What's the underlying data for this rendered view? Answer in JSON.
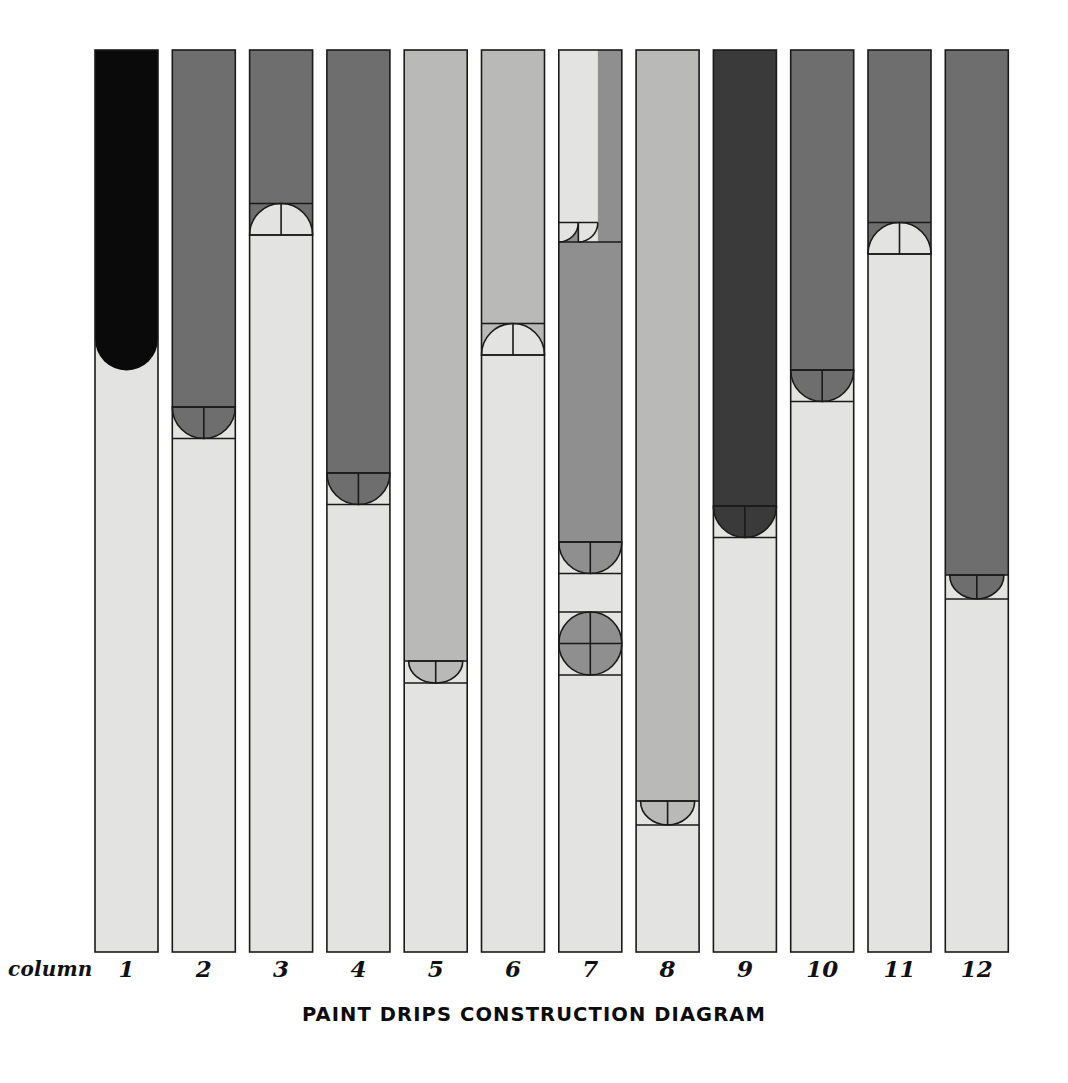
{
  "title": "PAINT DRIPS CONSTRUCTION DIAGRAM",
  "axis": {
    "row_label": "column",
    "numbers": [
      "1",
      "2",
      "3",
      "4",
      "5",
      "6",
      "7",
      "8",
      "9",
      "10",
      "11",
      "12"
    ]
  },
  "palette": {
    "background": "#ffffff",
    "outline": "#1a1a1a",
    "body_light": "#e3e3e1",
    "ink_black": "#0a0a0a",
    "ink_dark": "#3a3a3a",
    "ink_mid_dark": "#6e6e6e",
    "ink_mid": "#8f8f8f",
    "ink_light": "#b9b9b7",
    "ink_pale": "#d6d6d4",
    "ink_paler": "#ececea"
  },
  "chart_data": {
    "type": "diagram",
    "title": "PAINT DRIPS CONSTRUCTION DIAGRAM",
    "xlabel": "column",
    "ylabel": "",
    "grid": false,
    "legend": "none",
    "geometry": {
      "columns_total": 12,
      "column_width_px": 63,
      "column_pitch_px": 77.3,
      "first_column_left_px": 95,
      "top_px": 50,
      "bottom_px": 952,
      "note": "Each column is a vertical bar of paint that has run down from the top; the paint front terminates in a semicircular drip bead of the same radius as the column half-width. Construction lines show the bead's bounding box, its vertical centre line and, for full circles, the horizontal centre line."
    },
    "categories": [
      "1",
      "2",
      "3",
      "4",
      "5",
      "6",
      "7",
      "8",
      "9",
      "10",
      "11",
      "12"
    ],
    "values": [
      289,
      357,
      185,
      423,
      611,
      305,
      192,
      751,
      456,
      320,
      204,
      525
    ],
    "series": [
      {
        "name": "paint front depth (px from top of column)",
        "values": [
          289,
          357,
          185,
          423,
          611,
          305,
          192,
          751,
          456,
          320,
          204,
          525
        ]
      },
      {
        "name": "drip bead count",
        "values": [
          1,
          1,
          1,
          1,
          1,
          1,
          4,
          1,
          1,
          1,
          1,
          1
        ]
      }
    ],
    "columns": [
      {
        "n": "1",
        "fill": "#0a0a0a",
        "tone": "black",
        "front_y": 289,
        "bead": {
          "shape": "semicircle-down",
          "orientation": "down",
          "size": "full",
          "radius_px": 31.5,
          "construction_lines": false
        },
        "description": "Solid black paint ending in a full rounded drip nose with no construction lines drawn."
      },
      {
        "n": "2",
        "fill": "#6e6e6e",
        "tone": "mid-dark",
        "front_y": 357,
        "bead": {
          "shape": "semicircle-down",
          "orientation": "down",
          "size": "full",
          "radius_px": 31.5,
          "construction_lines": true
        },
        "description": "Mid-dark grey paint; drip bead hangs below the front line with box and centre line."
      },
      {
        "n": "3",
        "fill": "#6e6e6e",
        "tone": "mid-dark",
        "front_y": 185,
        "bead": {
          "shape": "semicircle-up",
          "orientation": "up",
          "size": "full",
          "radius_px": 31.5,
          "construction_lines": true
        },
        "description": "Bead drawn as an upward dome of the pale body colour biting into the dark paint."
      },
      {
        "n": "4",
        "fill": "#6e6e6e",
        "tone": "mid-dark",
        "front_y": 423,
        "bead": {
          "shape": "semicircle-down",
          "orientation": "down",
          "size": "full",
          "radius_px": 31.5,
          "construction_lines": true
        },
        "description": "Large hanging semicircular bead with bounding box and vertical centre line."
      },
      {
        "n": "5",
        "fill": "#b9b9b7",
        "tone": "light",
        "front_y": 611,
        "bead": {
          "shape": "semicircle-down",
          "orientation": "down",
          "size": "half",
          "radius_px": 22,
          "construction_lines": true
        },
        "description": "Light grey paint running far down the column, terminating in a shallow bead."
      },
      {
        "n": "6",
        "fill": "#b9b9b7",
        "tone": "light",
        "front_y": 305,
        "bead": {
          "shape": "semicircle-up",
          "orientation": "up",
          "size": "full",
          "radius_px": 31.5,
          "construction_lines": true
        },
        "description": "Upward dome bead; pale body colour arches into the light grey paint."
      },
      {
        "n": "7",
        "fill": "#8f8f8f",
        "tone": "mid",
        "front_y": 192,
        "bead": {
          "shape": "multi",
          "orientation": "mixed",
          "size": "mixed",
          "radius_px": 31.5,
          "construction_lines": true
        },
        "description": "Stacked construction study: a narrow pale channel with a rounded foot at the top, then a long mid-grey run ending in a semicircular bead, then a detached full circle bead below it.",
        "sub_beads": [
          {
            "shape": "semicircle-down",
            "at_y": 192,
            "note": "foot of the narrow pale channel, left half only"
          },
          {
            "shape": "semicircle-down",
            "at_y": 492,
            "note": "bead at the foot of the long mid-grey run"
          },
          {
            "shape": "circle",
            "at_y": 562,
            "note": "detached full circle drip, horizontal and vertical centre lines"
          }
        ]
      },
      {
        "n": "8",
        "fill": "#b9b9b7",
        "tone": "light",
        "front_y": 751,
        "bead": {
          "shape": "semicircle-down",
          "orientation": "down",
          "size": "half",
          "radius_px": 24,
          "construction_lines": true
        },
        "description": "Longest run on the sheet; light grey reaches almost to the base before beading."
      },
      {
        "n": "9",
        "fill": "#3a3a3a",
        "tone": "dark",
        "front_y": 456,
        "bead": {
          "shape": "semicircle-down",
          "orientation": "down",
          "size": "full",
          "radius_px": 31.5,
          "construction_lines": true
        },
        "description": "Near-black paint with a heavy rounded drip and full construction box."
      },
      {
        "n": "10",
        "fill": "#6e6e6e",
        "tone": "mid-dark",
        "front_y": 320,
        "bead": {
          "shape": "semicircle-down",
          "orientation": "down",
          "size": "full",
          "radius_px": 31.5,
          "construction_lines": true
        },
        "description": "Mid-dark run with a full hanging bead."
      },
      {
        "n": "11",
        "fill": "#6e6e6e",
        "tone": "mid-dark",
        "front_y": 204,
        "bead": {
          "shape": "semicircle-up",
          "orientation": "up",
          "size": "full",
          "radius_px": 31.5,
          "construction_lines": true
        },
        "description": "Short run ending in an upward dome of the pale body colour."
      },
      {
        "n": "12",
        "fill": "#6e6e6e",
        "tone": "mid-dark",
        "front_y": 525,
        "bead": {
          "shape": "semicircle-down",
          "orientation": "down",
          "size": "half",
          "radius_px": 24,
          "construction_lines": true
        },
        "description": "Mid-dark run ending in a shallow partial bead near mid-height."
      }
    ]
  }
}
